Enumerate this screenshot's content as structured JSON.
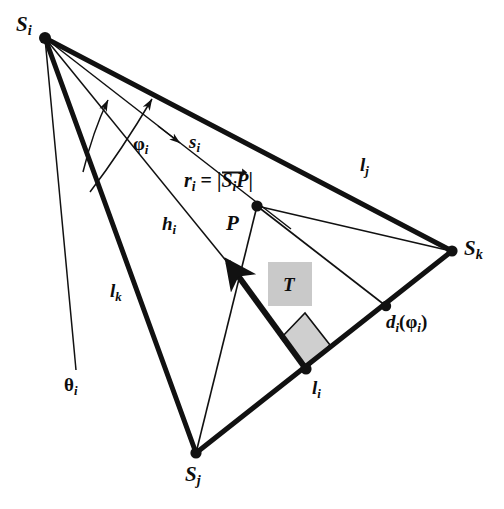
{
  "figure": {
    "background_color": "#ffffff",
    "stroke_color": "#111111",
    "fill_gray": "#c8c8c8",
    "width": 504,
    "height": 509
  },
  "vertices": [
    {
      "id": "Si",
      "label_main": "S",
      "label_sub": "i",
      "x": 45,
      "y": 38
    },
    {
      "id": "Sj",
      "label_main": "S",
      "label_sub": "j",
      "x": 196,
      "y": 453
    },
    {
      "id": "Sk",
      "label_main": "S",
      "label_sub": "k",
      "x": 452,
      "y": 251
    },
    {
      "id": "P",
      "label_main": "P",
      "label_sub": "",
      "x": 257,
      "y": 206
    },
    {
      "id": "Li",
      "label_main": "l",
      "label_sub": "i",
      "x": 306,
      "y": 369
    },
    {
      "id": "Di",
      "label_main": "d",
      "label_sub": "i",
      "x": 386,
      "y": 306
    }
  ],
  "labels": {
    "Si": {
      "main": "S",
      "sub": "i",
      "x": 16,
      "y": 16,
      "size": "vertex"
    },
    "Sj": {
      "main": "S",
      "sub": "j",
      "x": 186,
      "y": 466,
      "size": "vertex"
    },
    "Sk": {
      "main": "S",
      "sub": "k",
      "x": 464,
      "y": 240,
      "size": "vertex"
    },
    "P": {
      "main": "P",
      "sub": "",
      "x": 228,
      "y": 216,
      "size": "vertex"
    },
    "lj": {
      "main": "l",
      "sub": "j",
      "x": 361,
      "y": 160,
      "size": "edge"
    },
    "lk": {
      "main": "l",
      "sub": "k",
      "x": 111,
      "y": 284,
      "size": "edge"
    },
    "li": {
      "main": "l",
      "sub": "i",
      "x": 313,
      "y": 382,
      "size": "edge"
    },
    "hi": {
      "main": "h",
      "sub": "i",
      "x": 163,
      "y": 217,
      "size": "edge"
    },
    "si": {
      "main": "s",
      "sub": "i",
      "x": 189,
      "y": 136,
      "size": "edge"
    },
    "phi_i": {
      "main": "φ",
      "sub": "i",
      "x": 134,
      "y": 136,
      "size": "small"
    },
    "theta_i": {
      "main": "θ",
      "sub": "i",
      "x": 66,
      "y": 378,
      "size": "small"
    },
    "T": {
      "main": "T",
      "sub": "",
      "x": 283,
      "y": 276,
      "size": "edge"
    },
    "di_phi_i": {
      "prefix": "d",
      "sub1": "i",
      "open": "(",
      "greek": "φ",
      "sub2": "i",
      "close": ")",
      "x": 387,
      "y": 316,
      "size": "small"
    },
    "r_formula": {
      "lhs_main": "r",
      "lhs_sub": "i",
      "eq": " = ",
      "bar_left": "|",
      "vec_main": "S",
      "vec_sub": "i",
      "vec_tail": "P",
      "bar_right": "|",
      "x": 184,
      "y": 176,
      "size": "formula"
    }
  },
  "segments": {
    "thick": [
      {
        "name": "edge-lj-Si-Sk",
        "x1": 45,
        "y1": 38,
        "x2": 452,
        "y2": 251
      },
      {
        "name": "edge-lk-Si-Sj",
        "x1": 45,
        "y1": 38,
        "x2": 196,
        "y2": 453
      },
      {
        "name": "edge-li-Sj-Sk",
        "x1": 196,
        "y1": 453,
        "x2": 452,
        "y2": 251
      },
      {
        "name": "perp-hi-arrow",
        "x1": 306,
        "y1": 369,
        "x2": 226,
        "y2": 259
      }
    ],
    "thin": [
      {
        "name": "ray-si-Si-P",
        "x1": 45,
        "y1": 38,
        "x2": 290,
        "y2": 228
      },
      {
        "name": "ray-hi-Si-foot",
        "x1": 45,
        "y1": 38,
        "x2": 248,
        "y2": 288
      },
      {
        "name": "ray-theta-Si-end",
        "x1": 45,
        "y1": 38,
        "x2": 76,
        "y2": 368
      },
      {
        "name": "chord-P-Sk",
        "x1": 257,
        "y1": 206,
        "x2": 452,
        "y2": 251
      },
      {
        "name": "chord-P-Di",
        "x1": 257,
        "y1": 206,
        "x2": 386,
        "y2": 306
      },
      {
        "name": "chord-P-Sj",
        "x1": 257,
        "y1": 206,
        "x2": 196,
        "y2": 453
      }
    ],
    "arcs": [
      {
        "name": "angle-arc-phi",
        "d": "M 97 178 A 150 150 0 0 1 143 118"
      },
      {
        "name": "angle-arc-theta",
        "d": "M 78 157 A 135 135 0 0 1 105 106"
      }
    ]
  },
  "markers": {
    "right_angle": {
      "name": "right-angle-marker",
      "points": "306,369 281,338 305,313 330,345"
    },
    "t_box": {
      "name": "region-T-box",
      "x": 268,
      "y": 262,
      "width": 44,
      "height": 44
    },
    "dot_radius": 5.2
  }
}
